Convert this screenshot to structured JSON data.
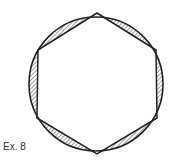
{
  "figure": {
    "label": "Ex. 8",
    "circle": {
      "cx": 96,
      "cy": 84,
      "r": 67
    },
    "hexagon_vertices": [
      [
        97,
        13
      ],
      [
        156,
        50
      ],
      [
        157,
        118
      ],
      [
        97,
        154
      ],
      [
        37,
        118
      ],
      [
        38,
        50
      ]
    ],
    "colors": {
      "stroke": "#222222",
      "hatch": "#333333",
      "background": "#ffffff"
    }
  }
}
